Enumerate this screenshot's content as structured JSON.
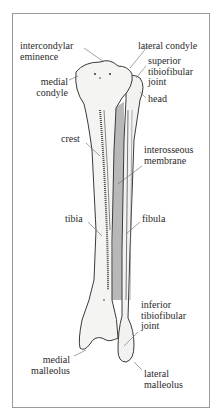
{
  "figure": {
    "colors": {
      "bone": "#f4f4f2",
      "bone_shadow": "#cfcfcf",
      "membrane": "#b8b8b8",
      "outline": "#3a3a3a",
      "leader": "#666666",
      "frame": "#9a9a9a"
    },
    "labels": {
      "intercondylar_eminence": "intercondylar\neminence",
      "lateral_condyle": "lateral condyle",
      "medial_condyle": "medial\ncondyle",
      "superior_tibiofibular_joint": "superior\ntibiofibular\njoint",
      "head": "head",
      "crest": "crest",
      "interosseous_membrane": "interosseous\nmembrane",
      "tibia": "tibia",
      "fibula": "fibula",
      "inferior_tibiofibular_joint": "inferior\ntibiofibular\njoint",
      "medial_malleolus": "medial\nmalleolus",
      "lateral_malleolus": "lateral\nmalleolus"
    }
  }
}
